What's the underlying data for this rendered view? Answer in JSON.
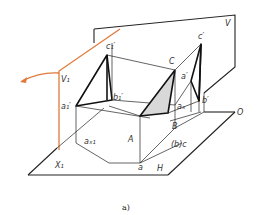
{
  "figure": {
    "caption": "a)",
    "colors": {
      "projection_plane_v1": "#e07a3a",
      "line": "#111111",
      "shade": "#d8d8d8"
    }
  },
  "labels": {
    "V": "V",
    "V1": "V₁",
    "H": "H",
    "X1": "X₁",
    "O": "O",
    "c1p": "c₁′",
    "b1p": "b₁′",
    "a1p": "a₁′",
    "ax1": "aₓ₁",
    "A": "A",
    "B": "B",
    "C": "C",
    "cp": "c′",
    "ap": "a′",
    "bp": "b′",
    "ax": "aₓ",
    "bc": "(b)c",
    "a": "a"
  }
}
